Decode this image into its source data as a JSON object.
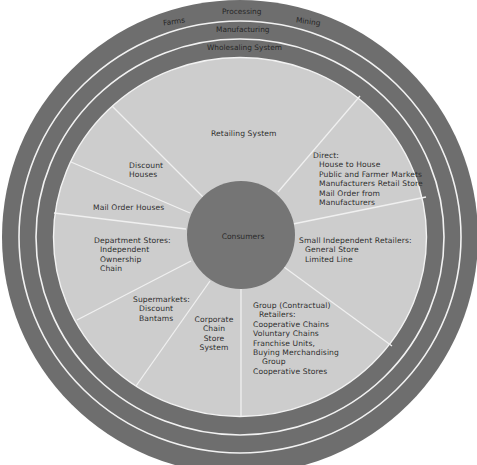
{
  "colors": {
    "background": "#ffffff",
    "outer_rings": "#6e6e6e",
    "ring_divider": "#f2f2f2",
    "retail_area": "#cdcdcd",
    "consumers_circle": "#757575",
    "spoke": "#f0f0f0",
    "text": "#2e2e2e"
  },
  "outer_ring": {
    "labels": {
      "left": "Farms",
      "center": "Processing",
      "right": "Mining"
    }
  },
  "middle_ring": {
    "label": "Manufacturing"
  },
  "inner_ring": {
    "label": "Wholesaling System"
  },
  "retail_area": {
    "title": "Retailing System",
    "center": {
      "label": "Consumers"
    },
    "sectors": {
      "direct": {
        "heading": "Direct:",
        "items": [
          "House to House",
          "Public and Farmer Markets",
          "Manufacturers Retail Store",
          "Mail Order from",
          "Manufacturers"
        ]
      },
      "small_independent": {
        "heading": "Small Independent Retailers:",
        "items": [
          "General Store",
          "Limited Line"
        ]
      },
      "group": {
        "heading": "Group (Contractual)",
        "heading2": "Retailers:",
        "items": [
          "Cooperative Chains",
          "Voluntary Chains",
          "Franchise Units,",
          "Buying Merchandising",
          "Group",
          "Cooperative Stores"
        ]
      },
      "corporate": {
        "lines": [
          "Corporate",
          "Chain",
          "Store",
          "System"
        ]
      },
      "supermarkets": {
        "heading": "Supermarkets:",
        "items": [
          "Discount",
          "Bantams"
        ]
      },
      "department_stores": {
        "heading": "Department Stores:",
        "items": [
          "Independent",
          "Ownership",
          "Chain"
        ]
      },
      "mail_order": {
        "label": "Mail Order Houses"
      },
      "discount_houses": {
        "lines": [
          "Discount",
          "Houses"
        ]
      }
    }
  }
}
